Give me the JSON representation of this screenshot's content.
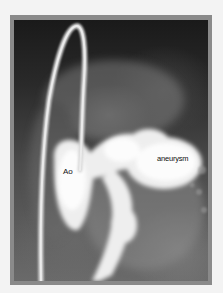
{
  "image": {
    "type": "aortic angiogram",
    "description": "Grayscale angiographic X-ray showing a catheter loop and contrast-filled aorta with a saccular aneurysm",
    "frame_color": "#8a8a8a",
    "background_color": "#f3f3f3"
  },
  "labels": {
    "ao": "Ao",
    "aneurysm": "aneurysm"
  }
}
